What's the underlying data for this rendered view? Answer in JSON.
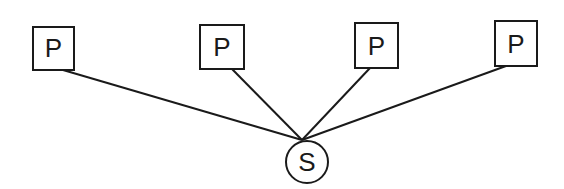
{
  "diagram": {
    "stroke_color": "#1a1a1a",
    "background": "#ffffff",
    "server": {
      "label": "S",
      "cx": 307,
      "cy": 162,
      "r": 21,
      "hub_x": 302,
      "hub_y": 140
    },
    "processes": [
      {
        "label": "P",
        "x": 33,
        "y": 27,
        "w": 41,
        "h": 43,
        "attach_x": 63,
        "attach_y": 70
      },
      {
        "label": "P",
        "x": 200,
        "y": 25,
        "w": 44,
        "h": 44,
        "attach_x": 232,
        "attach_y": 69
      },
      {
        "label": "P",
        "x": 355,
        "y": 23,
        "w": 43,
        "h": 45,
        "attach_x": 370,
        "attach_y": 68
      },
      {
        "label": "P",
        "x": 495,
        "y": 21,
        "w": 42,
        "h": 45,
        "attach_x": 506,
        "attach_y": 66
      }
    ]
  }
}
